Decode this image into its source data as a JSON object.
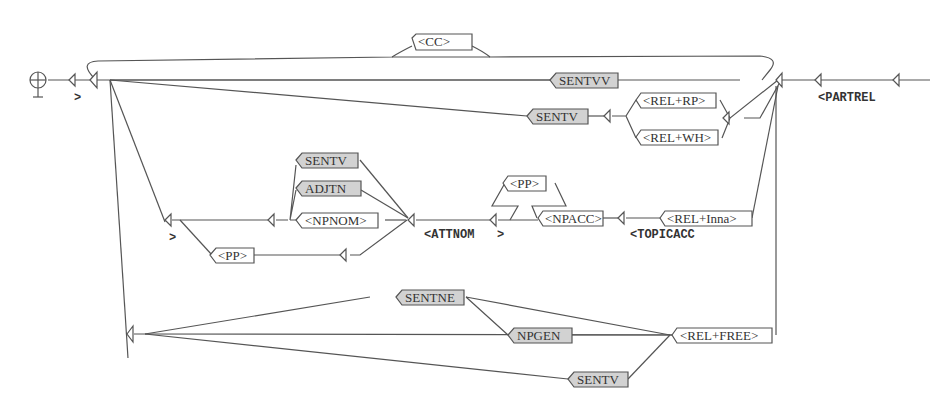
{
  "graph": {
    "initial_symbol": "initial-state-icon",
    "nodes": {
      "cc": "<CC>",
      "sentvv": "SENTVV",
      "sentv_top": "SENTV",
      "rel_rp": "<REL+RP>",
      "rel_wh": "<REL+WH>",
      "sentv_mid": "SENTV",
      "adjtn": "ADJTN",
      "npnom": "<NPNOM>",
      "pp_left": "<PP>",
      "pp_top": "<PP>",
      "npacc": "<NPACC>",
      "rel_inna": "<REL+Inna>",
      "sentne": "SENTNE",
      "npgen": "NPGEN",
      "rel_free": "<REL+FREE>",
      "sentv_bottom": "SENTV"
    },
    "outputs": {
      "close_main": ">",
      "partrel": "<PARTREL",
      "close_attnom": ">",
      "attnom": "<ATTNOM",
      "close_attnom_b": ">",
      "topicacc": "<TOPICACC"
    },
    "colors": {
      "line": "#555555",
      "subgraph_fill": "#d2d2d2",
      "box_fill": "#ffffff"
    }
  }
}
